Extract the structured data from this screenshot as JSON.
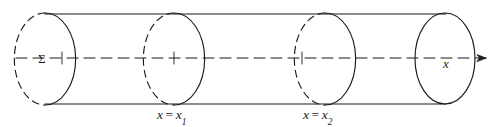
{
  "figure": {
    "background_color": "#ffffff",
    "stroke_color": "#1b1b1b",
    "width": 502,
    "height": 127,
    "labels": {
      "surface_sigma": "Σ",
      "axis_x": "x",
      "section_one_lhs": "x",
      "section_one_eq": "=",
      "section_one_rhs": "x",
      "section_one_sub": "1",
      "section_two_lhs": "x",
      "section_two_eq": "=",
      "section_two_rhs": "x",
      "section_two_sub": "2"
    },
    "geometry": {
      "cylinder_top_y": 14,
      "cylinder_bottom_y": 104,
      "axis_y": 58,
      "ellipse_rx": 30,
      "ellipse_ry": 45,
      "cross_sections": [
        {
          "name": "sigma-end-cap",
          "cx": 45,
          "style": "half-dashed"
        },
        {
          "name": "section-x1",
          "cx": 174,
          "style": "half-dashed"
        },
        {
          "name": "section-x2",
          "cx": 325,
          "style": "half-dashed"
        },
        {
          "name": "right-end-cap",
          "cx": 445,
          "style": "solid"
        }
      ],
      "axis_start_x": 16,
      "axis_end_x": 494,
      "axis_arrow": true,
      "tick_marks_x": [
        62,
        174,
        302,
        325
      ]
    }
  }
}
